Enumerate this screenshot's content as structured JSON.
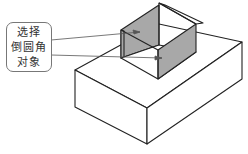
{
  "diagram": {
    "title": "",
    "callout": {
      "lines": [
        "选择",
        "倒圆角",
        "对象"
      ]
    },
    "colors": {
      "stroke": "#222222",
      "selected_face": "#a8a8a8",
      "leader": "#555555",
      "background": "#ffffff"
    },
    "objects": [
      {
        "name": "base-block",
        "description": "lower rectangular block"
      },
      {
        "name": "upper-u-shape",
        "description": "U-shaped raised wall with two selected inner faces"
      }
    ]
  }
}
